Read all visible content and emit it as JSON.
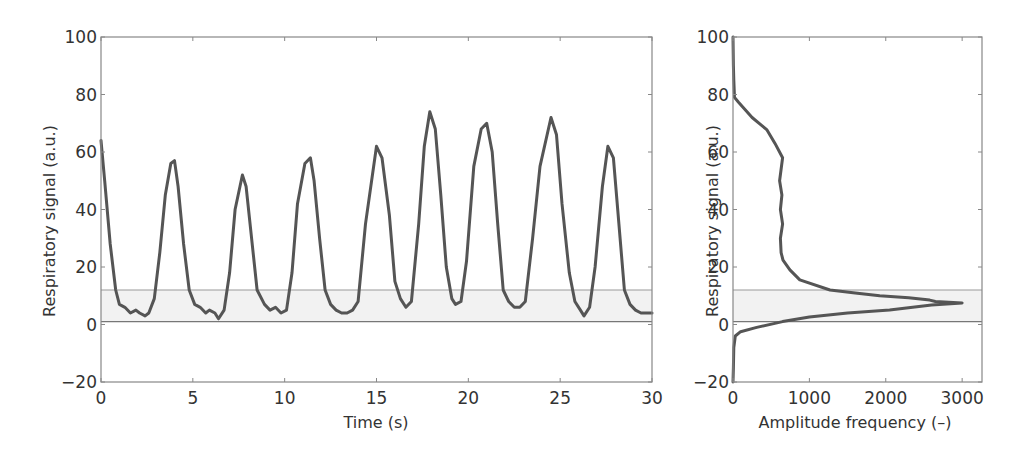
{
  "chart_data": [
    {
      "type": "line",
      "title": "",
      "xlabel": "Time (s)",
      "ylabel": "Respiratory signal (a.u.)",
      "xlim": [
        0,
        30
      ],
      "ylim": [
        -20,
        100
      ],
      "xticks": [
        0,
        5,
        10,
        15,
        20,
        25,
        30
      ],
      "yticks": [
        -20,
        0,
        20,
        40,
        60,
        80,
        100
      ],
      "xtick_labels": [
        "0",
        "5",
        "10",
        "15",
        "20",
        "25",
        "30"
      ],
      "ytick_labels": [
        "−20",
        "0",
        "20",
        "40",
        "60",
        "80",
        "100"
      ],
      "grid": false,
      "shaded_band": {
        "ymin": 1,
        "ymax": 12,
        "color": "#f2f2f2",
        "edge_color": "#999999"
      },
      "series": [
        {
          "name": "Respiratory signal",
          "color": "#555555",
          "x": [
            0.0,
            0.2,
            0.5,
            0.8,
            1.0,
            1.3,
            1.6,
            1.9,
            2.1,
            2.4,
            2.6,
            2.9,
            3.2,
            3.5,
            3.8,
            4.0,
            4.2,
            4.5,
            4.8,
            5.1,
            5.4,
            5.7,
            5.9,
            6.2,
            6.4,
            6.7,
            7.0,
            7.3,
            7.7,
            7.9,
            8.2,
            8.5,
            8.9,
            9.2,
            9.5,
            9.8,
            10.1,
            10.4,
            10.7,
            11.1,
            11.4,
            11.6,
            11.9,
            12.2,
            12.5,
            12.8,
            13.1,
            13.4,
            13.7,
            14.0,
            14.4,
            15.0,
            15.3,
            15.7,
            16.0,
            16.3,
            16.6,
            16.9,
            17.3,
            17.6,
            17.9,
            18.2,
            18.5,
            18.8,
            19.1,
            19.3,
            19.6,
            19.9,
            20.3,
            20.7,
            21.0,
            21.3,
            21.6,
            21.9,
            22.2,
            22.5,
            22.8,
            23.1,
            23.5,
            23.9,
            24.5,
            24.8,
            25.1,
            25.5,
            25.8,
            26.1,
            26.3,
            26.6,
            26.9,
            27.3,
            27.6,
            27.9,
            28.2,
            28.5,
            28.8,
            29.1,
            29.4,
            29.7,
            30.0
          ],
          "y": [
            64,
            50,
            28,
            12,
            7,
            6,
            4,
            5,
            4,
            3,
            4,
            9,
            25,
            45,
            56,
            57,
            48,
            28,
            12,
            7,
            6,
            4,
            5,
            4,
            2,
            5,
            18,
            40,
            52,
            48,
            30,
            12,
            7,
            5,
            6,
            4,
            5,
            18,
            42,
            56,
            58,
            50,
            30,
            12,
            7,
            5,
            4,
            4,
            5,
            8,
            35,
            62,
            58,
            38,
            15,
            9,
            6,
            8,
            35,
            62,
            74,
            68,
            45,
            20,
            9,
            7,
            8,
            22,
            55,
            68,
            70,
            60,
            35,
            12,
            8,
            6,
            6,
            8,
            30,
            55,
            72,
            66,
            42,
            18,
            8,
            5,
            3,
            6,
            20,
            48,
            62,
            58,
            35,
            12,
            7,
            5,
            4,
            4,
            4
          ]
        }
      ]
    },
    {
      "type": "line",
      "title": "",
      "xlabel": "Amplitude frequency (–)",
      "ylabel": "Respiratory signal (a.u.)",
      "xlim": [
        0,
        3260
      ],
      "ylim": [
        -20,
        100
      ],
      "xticks": [
        0,
        1000,
        2000,
        3000
      ],
      "yticks": [
        -20,
        0,
        20,
        40,
        60,
        80,
        100
      ],
      "xtick_labels": [
        "0",
        "1000",
        "2000",
        "3000"
      ],
      "ytick_labels": [
        "−20",
        "0",
        "20",
        "40",
        "60",
        "80",
        "100"
      ],
      "grid": false,
      "orientation": "horizontal histogram (frequency vs signal amplitude)",
      "shaded_band": {
        "ymin": 1,
        "ymax": 12,
        "color": "#f2f2f2",
        "edge_color": "#999999"
      },
      "series": [
        {
          "name": "Amplitude histogram",
          "color": "#555555",
          "frequency": [
            0,
            5,
            10,
            20,
            70,
            250,
            445,
            550,
            650,
            630,
            610,
            640,
            620,
            650,
            620,
            630,
            655,
            745,
            875,
            1270,
            1600,
            1920,
            2300,
            2575,
            2650,
            3000,
            2600,
            2050,
            1500,
            1000,
            650,
            310,
            100,
            30,
            10,
            5,
            0
          ],
          "signal": [
            100,
            90,
            85,
            79,
            77.4,
            72,
            67.7,
            63,
            58,
            54,
            50,
            45,
            40,
            35,
            30,
            25,
            22.4,
            19,
            15.5,
            12,
            11,
            10,
            9.3,
            8.5,
            8,
            7.5,
            6.8,
            5,
            4,
            2.6,
            1,
            -1,
            -2.5,
            -4,
            -8,
            -15,
            -20
          ]
        }
      ]
    }
  ],
  "plots": {
    "left": {
      "xlabel": "Time (s)",
      "ylabel": "Respiratory signal (a.u.)",
      "xtick_labels": [
        "0",
        "5",
        "10",
        "15",
        "20",
        "25",
        "30"
      ],
      "ytick_labels": [
        "−20",
        "0",
        "20",
        "40",
        "60",
        "80",
        "100"
      ]
    },
    "right": {
      "xlabel": "Amplitude frequency (–)",
      "ylabel": "Respiratory signal (a.u.)",
      "xtick_labels": [
        "0",
        "1000",
        "2000",
        "3000"
      ],
      "ytick_labels": [
        "−20",
        "0",
        "20",
        "40",
        "60",
        "80",
        "100"
      ]
    }
  },
  "colors": {
    "line": "#555555",
    "axis": "#888888",
    "band_fill": "#f2f2f2",
    "band_edge": "#999999",
    "text": "#333333"
  }
}
